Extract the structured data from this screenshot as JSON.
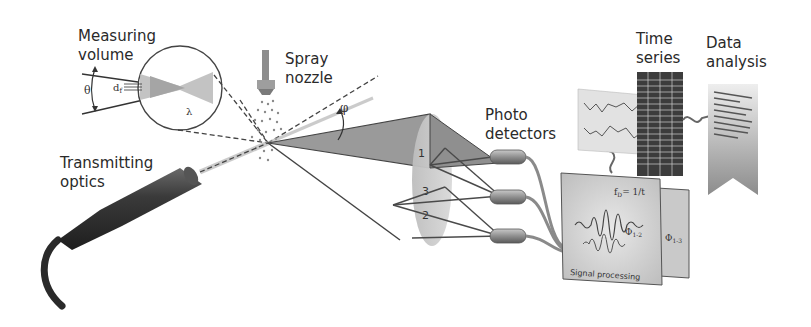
{
  "labels": {
    "measuring_volume": "Measuring\nvolume",
    "spray_nozzle": "Spray\nnozzle",
    "transmitting_optics": "Transmitting\noptics",
    "photo_detectors": "Photo\ndetectors",
    "time_series": "Time\nseries",
    "data_analysis": "Data\nanalysis",
    "signal_processing": "Signal processing"
  },
  "symbols": {
    "theta": "θ",
    "fringe_spacing": "d",
    "fringe_sub": "f",
    "wavelength": "λ",
    "phi": "φ",
    "frequency_eq": "f",
    "frequency_sub": "D",
    "frequency_rhs": "= 1/t",
    "phase_12": "Φ",
    "phase_12_sub": "1-2",
    "phase_13": "Φ",
    "phase_13_sub": "1-3"
  },
  "detector_zones": [
    "1",
    "3",
    "2"
  ],
  "colors": {
    "ink": "#2a2a2a",
    "probe_dark": "#2f2f2f",
    "beam_gray": "#8a8a8a",
    "lens_gray": "#c4c4c4",
    "panel_gray": "#d6d6d6",
    "dashed": "#444444"
  }
}
